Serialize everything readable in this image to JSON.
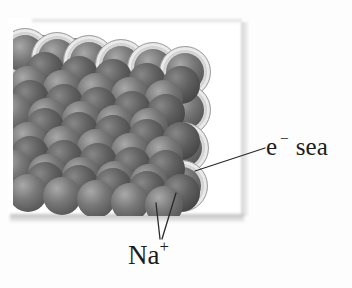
{
  "figure": {
    "labels": {
      "electron_sea": {
        "symbol": "e",
        "superscript": "−",
        "word": "sea"
      },
      "sodium_ion": {
        "symbol": "Na",
        "superscript": "+"
      }
    },
    "colors": {
      "page_bg": "#fdfdfd",
      "panel_bg": "#ffffff",
      "sphere_hi": "#a9a9a9",
      "sphere_mid": "#787878",
      "sphere_dark": "#4a4a4a",
      "halo_fill": "#dcdcdc",
      "halo_edge": "#a0a0a0",
      "leader_line": "#2b2b2b",
      "label_text": "#1c1c1c"
    },
    "illustration": {
      "sphere_diameter": 38,
      "halo_diameter": 52,
      "lattice_offset": {
        "x": 13,
        "y": 14
      },
      "rows": [
        {
          "x0": 14,
          "y0": 50,
          "dx": 32,
          "dy": 3.5,
          "n": 3,
          "halo": false,
          "shade": "dark"
        },
        {
          "x0": 25,
          "y0": 54,
          "dx": 32,
          "dy": 3.5,
          "n": 6,
          "halo": true,
          "shade": "normal"
        },
        {
          "x0": 184.5,
          "y0": 110,
          "dx": -1.2,
          "dy": 38,
          "n": 3,
          "halo": true,
          "shade": "normal"
        },
        {
          "x0": 45,
          "y0": 71,
          "dx": 34,
          "dy": 3.5,
          "n": 5,
          "halo": false,
          "shade": "dark"
        },
        {
          "x0": 28,
          "y0": 85,
          "dx": 34,
          "dy": 3.5,
          "n": 5,
          "halo": false,
          "shade": "normal"
        },
        {
          "x0": 30,
          "y0": 99,
          "dx": 34,
          "dy": 3.5,
          "n": 5,
          "halo": false,
          "shade": "dark"
        },
        {
          "x0": 13,
          "y0": 113,
          "dx": 34,
          "dy": 3.5,
          "n": 5,
          "halo": false,
          "shade": "normal"
        },
        {
          "x0": 45,
          "y0": 127,
          "dx": 34,
          "dy": 3.5,
          "n": 5,
          "halo": false,
          "shade": "dark"
        },
        {
          "x0": 28,
          "y0": 141,
          "dx": 34,
          "dy": 3.5,
          "n": 5,
          "halo": false,
          "shade": "normal"
        },
        {
          "x0": 30,
          "y0": 155,
          "dx": 34,
          "dy": 3.5,
          "n": 5,
          "halo": false,
          "shade": "dark"
        },
        {
          "x0": 13,
          "y0": 169,
          "dx": 34,
          "dy": 3.5,
          "n": 5,
          "halo": false,
          "shade": "normal"
        },
        {
          "x0": 45,
          "y0": 181,
          "dx": 34,
          "dy": 3,
          "n": 5,
          "halo": false,
          "shade": "dark"
        },
        {
          "x0": 28,
          "y0": 193,
          "dx": 34,
          "dy": 3,
          "n": 5,
          "halo": false,
          "shade": "normal"
        }
      ],
      "leader_lines": [
        {
          "x1": 195,
          "y1": 171,
          "x2": 265,
          "y2": 148
        },
        {
          "x1": 156,
          "y1": 203,
          "x2": 160,
          "y2": 239
        },
        {
          "x1": 176,
          "y1": 193,
          "x2": 162,
          "y2": 239
        }
      ]
    }
  }
}
